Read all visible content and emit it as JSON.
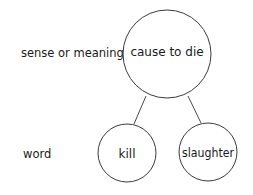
{
  "diagram": {
    "type": "semantic-tree",
    "row_labels": {
      "sense": "sense or meaning",
      "word": "word"
    },
    "nodes": {
      "sense": {
        "label": "cause to die"
      },
      "word1": {
        "label": "kill"
      },
      "word2": {
        "label": "slaughter"
      }
    },
    "edges": [
      {
        "from": "cause to die",
        "to": "kill"
      },
      {
        "from": "cause to die",
        "to": "slaughter"
      }
    ],
    "colors": {
      "background": "#ffffff",
      "stroke": "#3a3a3a",
      "text": "#1a1a1a"
    }
  }
}
